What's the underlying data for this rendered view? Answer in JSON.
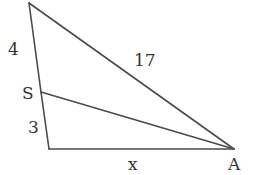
{
  "diagram": {
    "type": "triangle",
    "stroke_color": "#4a4a4a",
    "vertices": {
      "top": {
        "x": 29,
        "y": 3
      },
      "bottom_left": {
        "x": 49,
        "y": 149
      },
      "A": {
        "x": 234,
        "y": 149
      },
      "S": {
        "x": 41,
        "y": 92
      }
    },
    "segments": [
      {
        "from": "top",
        "to": "S",
        "label": "4"
      },
      {
        "from": "S",
        "to": "bottom_left",
        "label": "3"
      },
      {
        "from": "top",
        "to": "A",
        "label": "17"
      },
      {
        "from": "bottom_left",
        "to": "A",
        "label": "x"
      },
      {
        "from": "S",
        "to": "A",
        "label": ""
      }
    ],
    "labels": {
      "side_top_left": "4",
      "side_bottom_left": "3",
      "hypotenuse": "17",
      "base": "x",
      "point_s": "S",
      "point_a": "A"
    }
  }
}
